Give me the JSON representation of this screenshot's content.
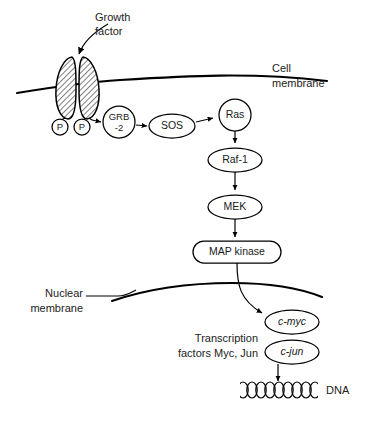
{
  "figure": {
    "background_color": "#ffffff",
    "line_color": "#000000",
    "text_color": "#222222"
  },
  "annotations": {
    "growth_factor_line1": "Growth",
    "growth_factor_line2": "factor",
    "cell_membrane_line1": "Cell",
    "cell_membrane_line2": "membrane",
    "nuclear_membrane_line1": "Nuclear",
    "nuclear_membrane_line2": "membrane",
    "transcription_line1": "Transcription",
    "transcription_line2": "factors Myc, Jun",
    "dna_label": "DNA"
  },
  "receptor": {
    "phospho_left": "P",
    "phospho_right": "P"
  },
  "nodes": [
    {
      "id": "grb2",
      "line1": "GRB",
      "line2": "-2",
      "shape": "circle"
    },
    {
      "id": "sos",
      "label": "SOS",
      "shape": "ellipse"
    },
    {
      "id": "ras",
      "label": "Ras",
      "shape": "circle"
    },
    {
      "id": "raf1",
      "label": "Raf-1",
      "shape": "ellipse"
    },
    {
      "id": "mek",
      "label": "MEK",
      "shape": "ellipse"
    },
    {
      "id": "mapkinase",
      "label": "MAP kinase",
      "shape": "rounded-rect"
    },
    {
      "id": "cmyc",
      "label": "c-myc",
      "shape": "ellipse",
      "style": "italic"
    },
    {
      "id": "cjun",
      "label": "c-jun",
      "shape": "ellipse",
      "style": "italic"
    }
  ],
  "caption": {
    "cut_off_line": ""
  }
}
